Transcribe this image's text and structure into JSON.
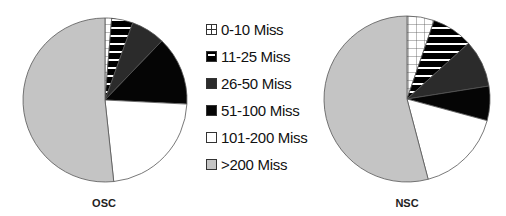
{
  "chart_data": [
    {
      "type": "pie",
      "title": "OSC",
      "categories": [
        "0-10 Miss",
        "11-25 Miss",
        "26-50 Miss",
        "51-100 Miss",
        "101-200 Miss",
        ">200 Miss"
      ],
      "values": [
        1.3,
        4.2,
        6.7,
        13.6,
        22.5,
        51.7
      ],
      "start_angle": "12 o'clock, clockwise",
      "legend_position": "center between pies"
    },
    {
      "type": "pie",
      "title": "NSC",
      "categories": [
        "0-10 Miss",
        "11-25 Miss",
        "26-50 Miss",
        "51-100 Miss",
        "101-200 Miss",
        ">200 Miss"
      ],
      "values": [
        5.3,
        8.0,
        9.2,
        6.7,
        16.7,
        54.1
      ],
      "start_angle": "12 o'clock, clockwise",
      "legend_position": "center between pies"
    }
  ],
  "legend": [
    {
      "label": "0-10 Miss",
      "pattern": "grid",
      "color": "#ffffff"
    },
    {
      "label": "11-25 Miss",
      "pattern": "hstripe",
      "color": "#000000"
    },
    {
      "label": "26-50 Miss",
      "pattern": "solid",
      "color": "#2b2b2b"
    },
    {
      "label": "51-100 Miss",
      "pattern": "solid",
      "color": "#050505"
    },
    {
      "label": "101-200 Miss",
      "pattern": "solid",
      "color": "#ffffff"
    },
    {
      "label": ">200 Miss",
      "pattern": "solid",
      "color": "#c4c4c4"
    }
  ],
  "labels": {
    "left": "OSC",
    "right": "NSC"
  }
}
